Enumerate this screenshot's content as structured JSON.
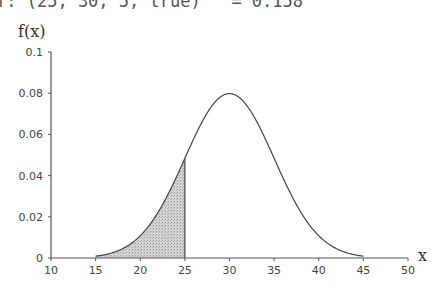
{
  "header": {
    "formula_text": "f: (25, 30, 5, true)   = 0.158"
  },
  "chart_data": {
    "type": "area",
    "title": "",
    "xlabel": "x",
    "ylabel": "f(x)",
    "xlim": [
      10,
      50
    ],
    "ylim": [
      0,
      0.1
    ],
    "x_ticks": [
      "10",
      "15",
      "20",
      "25",
      "30",
      "35",
      "40",
      "45",
      "50"
    ],
    "y_ticks": [
      "0",
      "0.02",
      "0.04",
      "0.06",
      "0.08",
      "0.1"
    ],
    "grid": false,
    "legend": null,
    "series": [
      {
        "name": "normal density",
        "mean": 30,
        "sd": 5,
        "x": [
          15,
          17.5,
          20,
          22.5,
          25,
          27.5,
          30,
          32.5,
          35,
          37.5,
          40,
          42.5,
          45
        ],
        "values": [
          0.0009,
          0.0035,
          0.0108,
          0.0259,
          0.0484,
          0.0704,
          0.0798,
          0.0704,
          0.0484,
          0.0259,
          0.0108,
          0.0035,
          0.0009
        ]
      }
    ],
    "shaded_region": {
      "from": 15,
      "to": 25,
      "color": "#c8c8c8"
    },
    "colors": {
      "curve": "#444444",
      "axis": "#555555",
      "shade": "#c8c8c8"
    }
  }
}
